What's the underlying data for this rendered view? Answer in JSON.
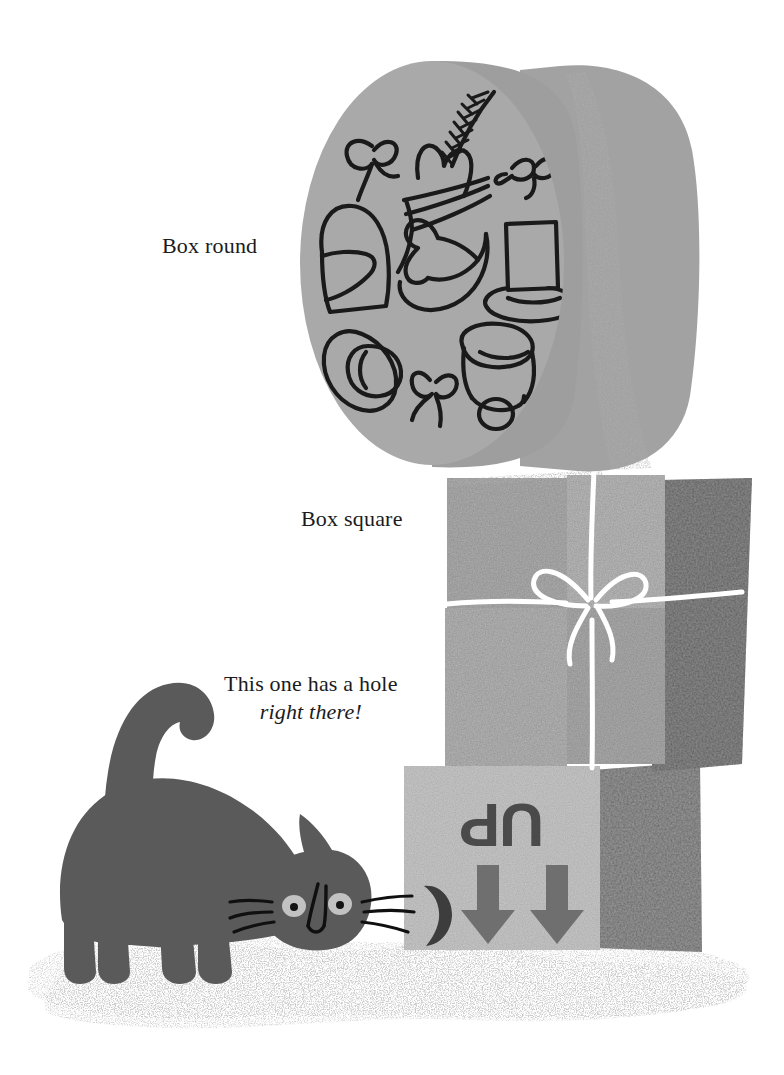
{
  "page": {
    "width": 784,
    "height": 1075,
    "background": "#ffffff",
    "kind": "picture-book-illustration"
  },
  "captions": {
    "box_round": "Box round",
    "box_square": "Box square",
    "hole_line1": "This one has a hole",
    "hole_line2": "right there!"
  },
  "labels": {
    "up_text": "UP",
    "up_orientation": "upside-down (rotated 180 degrees)",
    "arrow_count": 2,
    "arrow_direction": "down"
  },
  "objects": {
    "round_box": {
      "name": "round hat box",
      "lid_face_color": "#a9a9a9",
      "side_band_color": "#9a9a9a",
      "back_rim_color": "#a2a2a2",
      "speckle_band_color": "#8e8e8e",
      "drawings": [
        "bow",
        "feathered-hat",
        "bow",
        "cloche-hat",
        "fedora-hat",
        "top-hat",
        "wide-brim-hat",
        "bow",
        "bucket-hat"
      ],
      "ink_color": "#1a1a1a"
    },
    "square_box": {
      "name": "square wrapped box",
      "front_color": "#b3b3b3",
      "front_light_color": "#bdbdbd",
      "side_color": "#8e8e8e",
      "string_color": "#ffffff",
      "has_bow": true,
      "bow_position": "center"
    },
    "up_box": {
      "name": "bottom box marked UP",
      "front_color": "#c9c9c9",
      "side_color": "#9b9b9b",
      "mark_color": "#4a4a4a",
      "hole_color": "#3d3d3d",
      "hole_label": "hole in box"
    },
    "cat": {
      "name": "gray cat sniffing the hole",
      "body_color": "#5a5a5a",
      "eye_color": "#c2c2c2",
      "pupil_color": "#141414",
      "whisker_color": "#101010",
      "pose": "crouching, tail raised and curled"
    },
    "ground": {
      "name": "speckled ground",
      "color": "#8c8c8c"
    }
  }
}
